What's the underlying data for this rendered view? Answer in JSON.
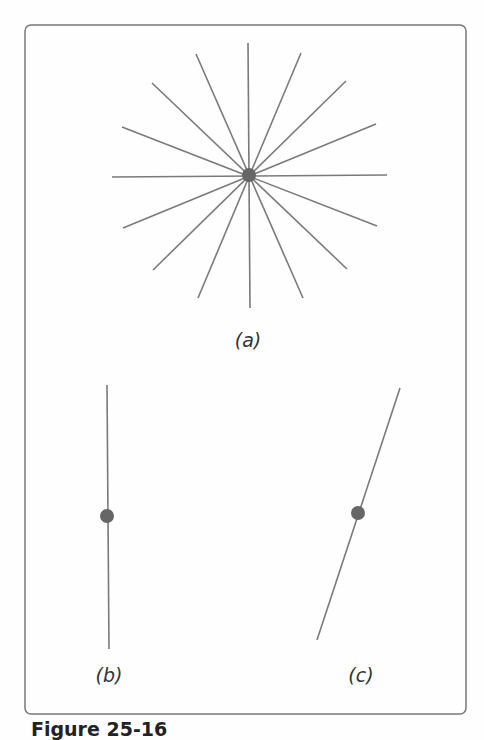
{
  "figure": {
    "caption": "Figure 25-16",
    "colors": {
      "frame": "#777777",
      "lines": "#7a7a7a",
      "dots": "#666666",
      "background": "#fefefe",
      "label": "#333333"
    },
    "frame": {
      "x": 25,
      "y": 25,
      "width": 441,
      "height": 689,
      "radius": 6
    },
    "panels": [
      {
        "id": "a",
        "label": "(a)",
        "label_pos": [
          248,
          347
        ],
        "description": "Sixteen-ray star of lines through a common point",
        "center": [
          249,
          175
        ],
        "dot_radius": 7,
        "lines": [
          [
            [
              248,
              43
            ],
            [
              250,
              308
            ]
          ],
          [
            [
              112,
              177
            ],
            [
              387,
              175
            ]
          ],
          [
            [
              196,
              54
            ],
            [
              303,
              298
            ]
          ],
          [
            [
              301,
              53
            ],
            [
              198,
              298
            ]
          ],
          [
            [
              152,
              83
            ],
            [
              347,
              269
            ]
          ],
          [
            [
              346,
              81
            ],
            [
              153,
              270
            ]
          ],
          [
            [
              122,
              127
            ],
            [
              377,
              226
            ]
          ],
          [
            [
              376,
              124
            ],
            [
              123,
              228
            ]
          ]
        ]
      },
      {
        "id": "b",
        "label": "(b)",
        "label_pos": [
          109,
          682
        ],
        "description": "Single vertical line with dot",
        "lines": [
          [
            [
              107,
              385
            ],
            [
              109,
              649
            ]
          ]
        ],
        "center": [
          107,
          516
        ],
        "dot_radius": 7
      },
      {
        "id": "c",
        "label": "(c)",
        "label_pos": [
          361,
          682
        ],
        "description": "Single tilted line with dot",
        "lines": [
          [
            [
              400,
              388
            ],
            [
              317,
              640
            ]
          ]
        ],
        "center": [
          358,
          513
        ],
        "dot_radius": 7
      }
    ]
  }
}
